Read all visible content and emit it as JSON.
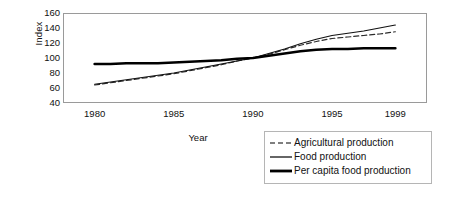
{
  "chart_data": {
    "type": "line",
    "title": "",
    "xlabel": "Year",
    "ylabel": "Index",
    "xlim": [
      1978,
      2001
    ],
    "ylim": [
      40,
      160
    ],
    "ytick_labels": [
      "160",
      "140",
      "120",
      "100",
      "80",
      "60",
      "40"
    ],
    "yticks": [
      160,
      140,
      120,
      100,
      80,
      60,
      40
    ],
    "xtick_labels": [
      "1980",
      "1985",
      "1990",
      "1995",
      "1999"
    ],
    "xticks": [
      1980,
      1985,
      1990,
      1995,
      1999
    ],
    "grid": false,
    "legend_position": "below-right",
    "x": [
      1980,
      1981,
      1982,
      1983,
      1984,
      1985,
      1986,
      1987,
      1988,
      1989,
      1990,
      1991,
      1992,
      1993,
      1994,
      1995,
      1996,
      1997,
      1998,
      1999
    ],
    "series": [
      {
        "name": "Agricultural production",
        "style": "dashed",
        "width": 1.2,
        "color": "#2b2b2b",
        "values": [
          64,
          67,
          70,
          73,
          76,
          79,
          83,
          87,
          91,
          96,
          100,
          105,
          111,
          117,
          122,
          126,
          128,
          130,
          132,
          135
        ]
      },
      {
        "name": "Food production",
        "style": "solid",
        "width": 1.2,
        "color": "#111111",
        "values": [
          65,
          68,
          71,
          74,
          77,
          80,
          84,
          88,
          92,
          96,
          100,
          106,
          112,
          119,
          125,
          130,
          133,
          136,
          140,
          144
        ]
      },
      {
        "name": "Per capita food production",
        "style": "solid-thick",
        "width": 2.6,
        "color": "#000000",
        "values": [
          92,
          92,
          93,
          93,
          93,
          94,
          95,
          96,
          97,
          99,
          100,
          103,
          106,
          109,
          111,
          112,
          112,
          113,
          113,
          113
        ]
      }
    ]
  },
  "legend": {
    "items": [
      {
        "label": "Agricultural production",
        "style": "dashed"
      },
      {
        "label": "Food production",
        "style": "solid"
      },
      {
        "label": "Per capita food production",
        "style": "solid-thick"
      }
    ]
  },
  "colors": {
    "frame": "#9a9a9a",
    "legend_border": "#b5b5b5",
    "text": "#111111",
    "background": "#ffffff"
  }
}
